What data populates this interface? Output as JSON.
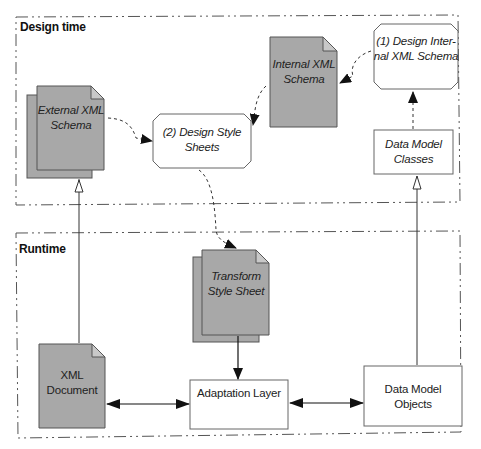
{
  "frames": {
    "design_time": {
      "title": "Design time"
    },
    "runtime": {
      "title": "Runtime"
    }
  },
  "nodes": {
    "external_xml_schema": {
      "line1": "External XML",
      "line2": "Schema",
      "shape": "stacked-document"
    },
    "design_style_sheets": {
      "line1": "(2) Design Style",
      "line2": "Sheets",
      "shape": "octagon"
    },
    "internal_xml_schema": {
      "line1": "Internal XML",
      "line2": "Schema",
      "shape": "document"
    },
    "design_internal_xml_schema": {
      "line1": "(1) Design Inter-",
      "line2": "nal XML Schema",
      "shape": "octagon"
    },
    "data_model_classes": {
      "line1": "Data Model",
      "line2": "Classes",
      "shape": "rectangle"
    },
    "transform_style_sheet": {
      "line1": "Transform",
      "line2": "Style Sheet",
      "shape": "stacked-document"
    },
    "xml_document": {
      "line1": "XML",
      "line2": "Document",
      "shape": "document"
    },
    "adaptation_layer": {
      "line1": "Adaptation Layer",
      "shape": "rectangle"
    },
    "data_model_objects": {
      "line1": "Data Model",
      "line2": "Objects",
      "shape": "rectangle"
    }
  },
  "edges": [
    {
      "from": "design_internal_xml_schema",
      "to": "internal_xml_schema",
      "style": "dashed-curved"
    },
    {
      "from": "data_model_classes",
      "to": "design_internal_xml_schema",
      "style": "dashed"
    },
    {
      "from": "internal_xml_schema",
      "to": "design_style_sheets",
      "style": "dashed-curved"
    },
    {
      "from": "external_xml_schema",
      "to": "design_style_sheets",
      "style": "dashed-curved"
    },
    {
      "from": "design_style_sheets",
      "to": "transform_style_sheet",
      "style": "dashed-curved"
    },
    {
      "from": "transform_style_sheet",
      "to": "adaptation_layer",
      "style": "solid"
    },
    {
      "from": "xml_document",
      "to": "adaptation_layer",
      "style": "solid-bidirectional"
    },
    {
      "from": "adaptation_layer",
      "to": "data_model_objects",
      "style": "solid-bidirectional"
    },
    {
      "from": "xml_document",
      "to": "external_xml_schema",
      "style": "instance-of-hollow"
    },
    {
      "from": "data_model_objects",
      "to": "data_model_classes",
      "style": "instance-of-hollow"
    }
  ],
  "colors": {
    "document_fill": "#a8a8a8",
    "document_stroke": "#555555",
    "box_stroke": "#666666",
    "frame_stroke": "#555555"
  }
}
